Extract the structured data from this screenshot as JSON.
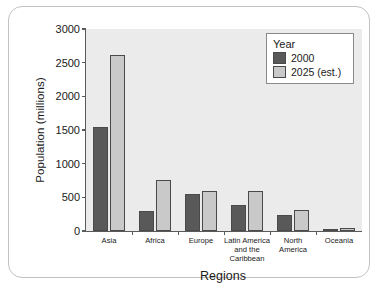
{
  "chart_data": {
    "type": "bar",
    "title": "",
    "xlabel": "Regions",
    "ylabel": "Population (millions)",
    "categories": [
      "Asia",
      "Africa",
      "Europe",
      "Latin America\nand the\nCaribbean",
      "North\nAmerica",
      "Oceania"
    ],
    "category_lines": [
      [
        "Asia"
      ],
      [
        "Africa"
      ],
      [
        "Europe"
      ],
      [
        "Latin America",
        "and the",
        "Caribbean"
      ],
      [
        "North",
        "America"
      ],
      [
        "Oceania"
      ]
    ],
    "series": [
      {
        "name": "2000",
        "color": "#595959",
        "values": [
          1540,
          300,
          545,
          385,
          240,
          30
        ]
      },
      {
        "name": "2025 (est.)",
        "color": "#c9c9c9",
        "values": [
          2610,
          760,
          600,
          600,
          310,
          43
        ]
      }
    ],
    "ylim": [
      0,
      3000
    ],
    "yticks": [
      0,
      500,
      1000,
      1500,
      2000,
      2500,
      3000
    ],
    "ytick_labels": [
      "0",
      "500",
      "1000",
      "1500",
      "2000",
      "2500",
      "3000"
    ],
    "grid": false,
    "legend": {
      "position": "top-right",
      "title": "Year",
      "entries": [
        {
          "label": "2000",
          "color": "#595959"
        },
        {
          "label": "2025 (est.)",
          "color": "#c9c9c9"
        }
      ]
    },
    "colors": {
      "plot_background": "#ebebeb",
      "figure_background": "#ffffff",
      "axis": "#5a5a5a",
      "frame_border": "#c2c2c2",
      "text": "#1a1a1a"
    }
  }
}
